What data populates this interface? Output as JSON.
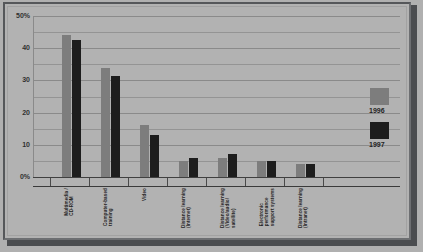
{
  "chart_data": {
    "type": "bar",
    "title": "",
    "xlabel": "",
    "ylabel": "",
    "ylim": [
      0,
      50
    ],
    "yticks": [
      0,
      10,
      20,
      30,
      40,
      50
    ],
    "ytick_labels": [
      "0%",
      "10",
      "20",
      "30",
      "40",
      "50%"
    ],
    "grid": true,
    "minor_gridline_step": 5,
    "legend_position": "right",
    "categories": [
      "Multimedia/\nCD-ROM",
      "Computer-based\ntraining",
      "Video",
      "Distance learning\n(Internet)",
      "Distance learning\n(Video/audio/\nsatellite)",
      "Electronic\nperformance\nsupport systems",
      "Distance learning\n(Intranet)"
    ],
    "series": [
      {
        "name": "1996",
        "color": "#7d7d7d",
        "values": [
          44,
          34,
          16,
          5,
          6,
          5,
          4
        ]
      },
      {
        "name": "1997",
        "color": "#1d1d1d",
        "values": [
          42.5,
          31.5,
          13,
          6,
          7,
          5,
          4
        ]
      }
    ]
  },
  "categories_lines": [
    [
      "Multimedia /",
      "CD-ROM"
    ],
    [
      "Computer-based",
      "training"
    ],
    [
      "Video"
    ],
    [
      "Distance learning",
      "(Internet)"
    ],
    [
      "Distance learning",
      "(Video/audio/",
      "satellite)"
    ],
    [
      "Electronic",
      "performance",
      "support systems"
    ],
    [
      "Distance learning",
      "(Intranet)"
    ]
  ],
  "legend": {
    "entries": [
      {
        "label": "1996",
        "color": "#7d7d7d"
      },
      {
        "label": "1997",
        "color": "#1d1d1d"
      }
    ]
  },
  "colors": {
    "background": "#b2b2b2",
    "frame_border": "#55575a",
    "frame_shadow": "#4b4d50",
    "gridline": "#949494",
    "axis": "#404040",
    "series_1996": "#7d7d7d",
    "series_1997": "#1d1d1d",
    "text": "#242424"
  }
}
